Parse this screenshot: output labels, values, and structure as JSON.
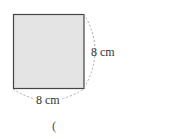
{
  "figure": {
    "shape": "square",
    "fill_color": "#e4e4e4",
    "border_color": "#444444",
    "dimension_color": "#aaaaaa",
    "side_label": "8 cm",
    "bottom_label": "8 cm"
  },
  "answer": {
    "open_paren": "("
  }
}
